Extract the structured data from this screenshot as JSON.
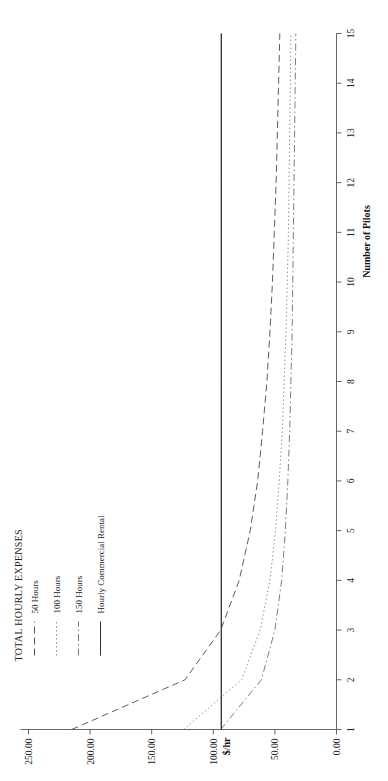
{
  "figure": {
    "legend_title": "TOTAL HOURLY EXPENSES",
    "xlabel": "Number of Pilots",
    "ylabel": "$/hr"
  },
  "chart_data": {
    "type": "line",
    "title": "TOTAL HOURLY EXPENSES",
    "xlabel": "Number of Pilots",
    "ylabel": "$/hr",
    "orientation": "rotated-90-ccw",
    "grid": false,
    "legend_position": "top-left",
    "xlim": [
      1,
      15
    ],
    "ylim": [
      0,
      250
    ],
    "xticks": [
      1,
      2,
      3,
      4,
      5,
      6,
      7,
      8,
      9,
      10,
      11,
      12,
      13,
      14,
      15
    ],
    "xtick_labels": [
      "1",
      "2",
      "3",
      "4",
      "5",
      "6",
      "7",
      "8",
      "9",
      "10",
      "11",
      "12",
      "13",
      "14",
      "15"
    ],
    "yticks": [
      0,
      50,
      100,
      150,
      200,
      250
    ],
    "ytick_labels": [
      "0.00",
      "50.00",
      "100.00",
      "150.00",
      "200.00",
      "250.00"
    ],
    "x": [
      1,
      2,
      3,
      4,
      5,
      6,
      7,
      8,
      9,
      10,
      11,
      12,
      13,
      14,
      15
    ],
    "series": [
      {
        "name": "50 Hours",
        "style": "dashed",
        "color": "#555555",
        "values": [
          215.0,
          123.0,
          94.0,
          79.0,
          70.0,
          64.0,
          60.0,
          56.5,
          54.0,
          52.0,
          50.5,
          49.0,
          48.0,
          47.0,
          46.0
        ]
      },
      {
        "name": "100 Hours",
        "style": "dotted",
        "color": "#888888",
        "values": [
          124.0,
          77.0,
          62.0,
          54.0,
          49.5,
          46.5,
          44.0,
          42.5,
          41.0,
          40.0,
          39.0,
          38.5,
          38.0,
          37.5,
          37.0
        ]
      },
      {
        "name": "150 Hours",
        "style": "dash-dot",
        "color": "#777777",
        "values": [
          94.0,
          61.0,
          50.0,
          44.5,
          41.5,
          39.5,
          38.0,
          37.0,
          36.0,
          35.5,
          35.0,
          34.5,
          34.0,
          33.5,
          33.0
        ]
      },
      {
        "name": "Hourly Commercial Rental",
        "style": "solid",
        "color": "#333333",
        "constant": 93.5,
        "values": [
          93.5,
          93.5,
          93.5,
          93.5,
          93.5,
          93.5,
          93.5,
          93.5,
          93.5,
          93.5,
          93.5,
          93.5,
          93.5,
          93.5,
          93.5
        ]
      }
    ],
    "legend": [
      {
        "label": "50 Hours",
        "style": "dashed"
      },
      {
        "label": "100 Hours",
        "style": "dotted"
      },
      {
        "label": "150 Hours",
        "style": "dash-dot"
      },
      {
        "label": "Hourly Commercial Rental",
        "style": "solid"
      }
    ]
  }
}
